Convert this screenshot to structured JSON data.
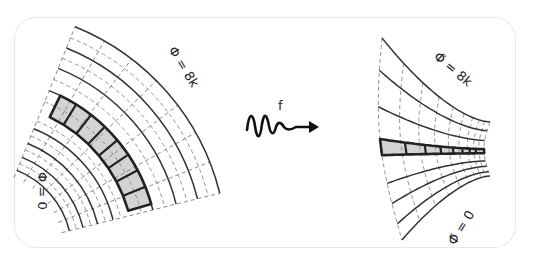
{
  "figure": {
    "left_panel": {
      "outer_label": "Φ = 8k",
      "inner_label": "Φ = 0",
      "shaded_cells": 8,
      "description": "polar grid with shaded ring of cells"
    },
    "transform": {
      "label": "f",
      "icon": "squiggle-arrow-icon"
    },
    "right_panel": {
      "outer_label": "Φ̃ = 8k",
      "inner_label": "Φ̃ = 0",
      "shaded_cells": 8,
      "description": "warped grid with shaded horizontal band of shrinking cells"
    },
    "colors": {
      "line": "#333333",
      "dashed": "#888888",
      "shade": "#d3d3d3",
      "frame": "#cfcfcf"
    }
  }
}
